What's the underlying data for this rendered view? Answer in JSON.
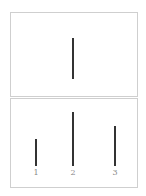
{
  "title_fragment": "",
  "top_panel": {
    "bars": [
      {
        "label": "",
        "height_px": 41
      }
    ]
  },
  "bottom_panel": {
    "bars": [
      {
        "label": "1",
        "height_px": 27
      },
      {
        "label": "2",
        "height_px": 54
      },
      {
        "label": "3",
        "height_px": 40
      }
    ]
  },
  "colors": {
    "bar": "#333333",
    "border": "#cfcfcf",
    "label": "#888888"
  }
}
